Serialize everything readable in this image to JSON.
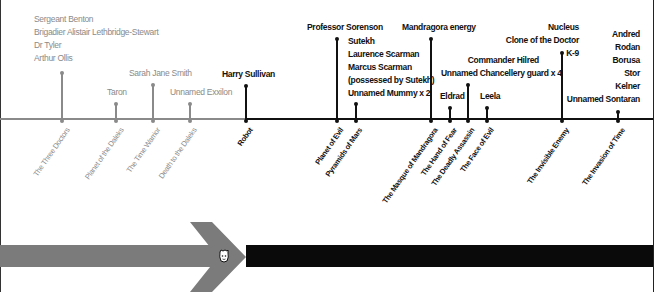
{
  "colors": {
    "past": "#8a8a8a",
    "current": "#111111",
    "bar_past": "#7b7b7b",
    "bar_current": "#0a0a0a"
  },
  "timeline": {
    "episodes": [
      {
        "title": "The Three Doctors",
        "era": "past",
        "x": 62,
        "stem_top": 72,
        "characters": [
          "Sergeant Benton",
          "Brigadier Alistair Lethbridge-Stewart",
          "Dr Tyler",
          "Arthur Ollis"
        ]
      },
      {
        "title": "Planet of the Daleks",
        "era": "past",
        "x": 116,
        "stem_top": 103,
        "characters": [
          "Taron"
        ]
      },
      {
        "title": "The Time Warrior",
        "era": "past",
        "x": 153,
        "stem_top": 84,
        "characters": [
          "Sarah Jane Smith"
        ]
      },
      {
        "title": "Death to the Daleks",
        "era": "past",
        "x": 190,
        "stem_top": 103,
        "characters": [
          "Unnamed Exxilon"
        ]
      },
      {
        "title": "Robot",
        "era": "current",
        "x": 246,
        "stem_top": 85,
        "characters": [
          "Harry Sullivan"
        ]
      },
      {
        "title": "Planet of Evil",
        "era": "current",
        "x": 337,
        "stem_top": 38,
        "characters": [
          "Professor Sorenson"
        ]
      },
      {
        "title": "Pyramids of Mars",
        "era": "current",
        "x": 356,
        "stem_top": 103,
        "characters": [
          "Sutekh",
          "Laurence Scarman",
          "Marcus Scarman",
          "(possessed by Sutekh)",
          "Unnamed Mummy x 2"
        ]
      },
      {
        "title": "The Masque of Mandragora",
        "era": "current",
        "x": 431,
        "stem_top": 38,
        "characters": [
          "Mandragora energy"
        ]
      },
      {
        "title": "The Hand of Fear",
        "era": "current",
        "x": 450,
        "stem_top": 107,
        "characters": [
          "Eldrad"
        ]
      },
      {
        "title": "The Deadly Assassin",
        "era": "current",
        "x": 468,
        "stem_top": 84,
        "characters": [
          "Commander Hilred",
          "Unnamed Chancellery guard x 4"
        ]
      },
      {
        "title": "The Face of Evil",
        "era": "current",
        "x": 487,
        "stem_top": 107,
        "characters": [
          "Leela"
        ]
      },
      {
        "title": "The Invisible Enemy",
        "era": "current",
        "x": 562,
        "stem_top": 52,
        "characters": [
          "Nucleus",
          "Clone of the Doctor",
          "K-9"
        ]
      },
      {
        "title": "The Invasion of Time",
        "era": "current",
        "x": 618,
        "stem_top": 111,
        "characters": [
          "Andred",
          "Rodan",
          "Borusa",
          "Stor",
          "Kelner",
          "Unnamed Sontaran"
        ]
      }
    ]
  },
  "progress_bar": {
    "icon": "doctor-face-icon"
  }
}
